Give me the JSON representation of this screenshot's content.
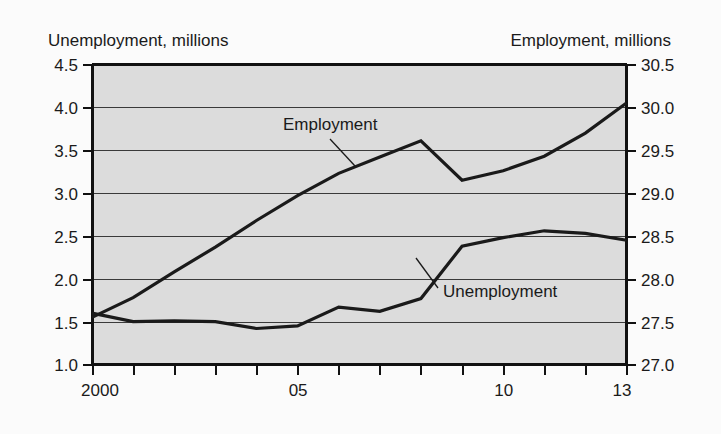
{
  "chart_data": {
    "type": "line",
    "title": "",
    "xlabel": "",
    "grid": true,
    "legend_position": "inline-annotations",
    "x": [
      2000,
      2001,
      2002,
      2003,
      2004,
      2005,
      2006,
      2007,
      2008,
      2009,
      2010,
      2011,
      2012,
      2013
    ],
    "xtick_values": [
      2000,
      2001,
      2002,
      2003,
      2004,
      2005,
      2006,
      2007,
      2008,
      2009,
      2010,
      2011,
      2012,
      2013
    ],
    "xtick_labels": [
      "2000",
      "",
      "",
      "",
      "",
      "05",
      "",
      "",
      "",
      "",
      "10",
      "",
      "",
      "13"
    ],
    "xlim": [
      2000,
      2013
    ],
    "left_axis": {
      "label": "Unemployment, millions",
      "ylim": [
        1.0,
        4.5
      ],
      "ticks": [
        1.0,
        1.5,
        2.0,
        2.5,
        3.0,
        3.5,
        4.0,
        4.5
      ],
      "tick_labels": [
        "1.0",
        "1.5",
        "2.0",
        "2.5",
        "3.0",
        "3.5",
        "4.0",
        "4.5"
      ]
    },
    "right_axis": {
      "label": "Employment, millions",
      "ylim": [
        27.0,
        30.5
      ],
      "ticks": [
        27.0,
        27.5,
        28.0,
        28.5,
        29.0,
        29.5,
        30.0,
        30.5
      ],
      "tick_labels": [
        "27.0",
        "27.5",
        "28.0",
        "28.5",
        "29.0",
        "29.5",
        "30.0",
        "30.5"
      ]
    },
    "series": [
      {
        "name": "Unemployment",
        "axis": "left",
        "units": "millions",
        "values": [
          1.6,
          1.5,
          1.51,
          1.5,
          1.42,
          1.45,
          1.67,
          1.62,
          1.77,
          2.38,
          2.48,
          2.56,
          2.53,
          2.45
        ]
      },
      {
        "name": "Employment",
        "axis": "right",
        "units": "millions",
        "values": [
          27.55,
          27.78,
          28.08,
          28.37,
          28.68,
          28.97,
          29.23,
          29.42,
          29.61,
          29.15,
          29.26,
          29.43,
          29.7,
          30.05
        ]
      }
    ],
    "annotations": [
      {
        "text": "Employment",
        "points_to_series": "Employment"
      },
      {
        "text": "Unemployment",
        "points_to_series": "Unemployment"
      }
    ]
  }
}
